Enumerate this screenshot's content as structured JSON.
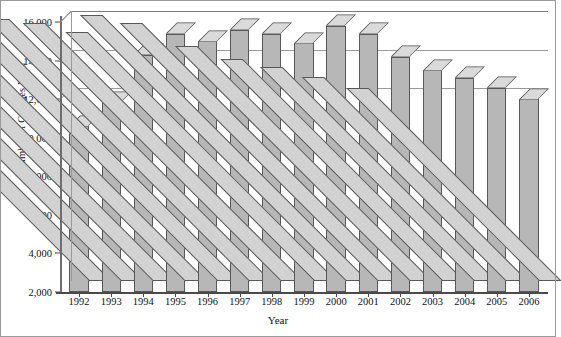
{
  "chart_data": {
    "type": "bar",
    "title": "",
    "xlabel": "Year",
    "ylabel": "Number of Charges Filed",
    "categories": [
      "1992",
      "1993",
      "1994",
      "1995",
      "1996",
      "1997",
      "1998",
      "1999",
      "2000",
      "2001",
      "2002",
      "2003",
      "2004",
      "2005",
      "2006"
    ],
    "values": [
      10600,
      11800,
      14300,
      15400,
      15000,
      15600,
      15400,
      14900,
      15800,
      15400,
      14200,
      13500,
      13100,
      12600,
      12000
    ],
    "ylim": [
      2000,
      16000
    ],
    "ytick_labels": [
      "16,000",
      "14,000",
      "12,000",
      "10,000",
      "8,000",
      "6,000",
      "4,000",
      "2,000"
    ],
    "ytick_values": [
      16000,
      14000,
      12000,
      10000,
      8000,
      6000,
      4000,
      2000
    ],
    "gridlines": [
      16000,
      14000,
      12000
    ],
    "grid": true,
    "legend": "none",
    "style": "3d-column",
    "colors": {
      "bar_front": "#b7b7b7",
      "bar_top": "#dadada",
      "bar_side": "#d2d2d2",
      "bar_outline": "#585858",
      "gridline": "#9a9a9a",
      "axis": "#4a4a4a",
      "background": "#ffffff"
    }
  }
}
